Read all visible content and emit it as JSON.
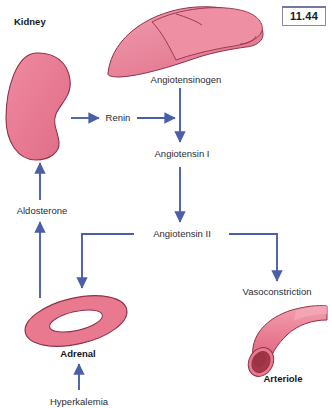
{
  "figure": {
    "number": "11.44",
    "background_color": "#ffffff",
    "arrow_color": "#4a5fa8",
    "organ_fill_color": "#e8798f",
    "organ_outline_color": "#8e3248",
    "lumen_color": "#a83848",
    "text_color": "#2b2b33"
  },
  "labels": {
    "kidney": "Kidney",
    "angiotensinogen": "Angiotensinogen",
    "renin": "Renin",
    "angiotensin_i": "Angiotensin I",
    "angiotensin_ii": "Angiotensin II",
    "aldosterone": "Aldosterone",
    "adrenal": "Adrenal",
    "hyperkalemia": "Hyperkalemia",
    "vasoconstriction": "Vasoconstriction",
    "arteriole": "Arteriole"
  },
  "organs": [
    {
      "name": "kidney",
      "label": "Kidney",
      "shape": "bean"
    },
    {
      "name": "liver",
      "label": "",
      "shape": "crescent"
    },
    {
      "name": "adrenal",
      "label": "Adrenal",
      "shape": "ring-ellipse"
    },
    {
      "name": "arteriole",
      "label": "Arteriole",
      "shape": "tube"
    }
  ],
  "flow": [
    {
      "from": "Kidney",
      "to": "Renin",
      "type": "arrow-right"
    },
    {
      "from": "Renin",
      "to": "Angiotensinogen pathway",
      "type": "arrow-right"
    },
    {
      "from": "Angiotensinogen",
      "to": "Angiotensin I",
      "type": "arrow-down"
    },
    {
      "from": "Angiotensin I",
      "to": "Angiotensin II",
      "type": "arrow-down"
    },
    {
      "from": "Angiotensin II",
      "to": "Adrenal",
      "type": "elbow-left-down"
    },
    {
      "from": "Angiotensin II",
      "to": "Vasoconstriction",
      "type": "elbow-right-down"
    },
    {
      "from": "Hyperkalemia",
      "to": "Adrenal",
      "type": "arrow-up"
    },
    {
      "from": "Adrenal",
      "to": "Aldosterone",
      "type": "arrow-up"
    },
    {
      "from": "Aldosterone",
      "to": "Kidney",
      "type": "arrow-up"
    }
  ]
}
